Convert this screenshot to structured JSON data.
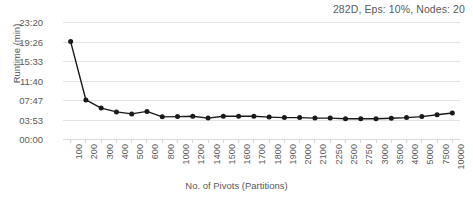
{
  "chart_title": "282D, Eps: 10%, Nodes: 20",
  "axes": {
    "x_title": "No. of Pivots (Partitions)",
    "y_title": "Runtime (min)"
  },
  "y_ticks": [
    "00:00",
    "03:53",
    "07:47",
    "11:40",
    "15:33",
    "19:26",
    "23:20"
  ],
  "chart_data": {
    "type": "line",
    "title": "282D, Eps: 10%, Nodes: 20",
    "xlabel": "No. of Pivots (Partitions)",
    "ylabel": "Runtime (min)",
    "ylim": [
      0,
      1400
    ],
    "ytick_labels": [
      "00:00",
      "03:53",
      "07:47",
      "11:40",
      "15:33",
      "19:26",
      "23:20"
    ],
    "ytick_values": [
      0,
      233,
      467,
      700,
      933,
      1166,
      1400
    ],
    "grid": true,
    "legend": "none",
    "categories": [
      "100",
      "200",
      "300",
      "400",
      "500",
      "600",
      "800",
      "1000",
      "1200",
      "1400",
      "1500",
      "1600",
      "1700",
      "1800",
      "1900",
      "2000",
      "2100",
      "2250",
      "2500",
      "2750",
      "3000",
      "3500",
      "4000",
      "5000",
      "7500",
      "10000"
    ],
    "series": [
      {
        "name": "Runtime",
        "values": [
          1166,
          467,
          370,
          324,
          300,
          330,
          265,
          268,
          272,
          250,
          272,
          272,
          272,
          262,
          256,
          256,
          250,
          250,
          242,
          242,
          242,
          248,
          256,
          268,
          290,
          312
        ],
        "value_labels": [
          "19:26",
          "07:47",
          "06:10",
          "05:24",
          "05:00",
          "05:30",
          "04:25",
          "04:28",
          "04:32",
          "04:10",
          "04:32",
          "04:32",
          "04:32",
          "04:22",
          "04:16",
          "04:16",
          "04:10",
          "04:10",
          "04:02",
          "04:02",
          "04:02",
          "04:08",
          "04:16",
          "04:28",
          "04:50",
          "05:12"
        ],
        "color": "#1a1a1a",
        "marker": "circle"
      }
    ]
  },
  "style": {
    "line_color": "#1a1a1a",
    "grid_color": "#e2e2e2",
    "text_color": "#595959",
    "background": "#ffffff"
  }
}
